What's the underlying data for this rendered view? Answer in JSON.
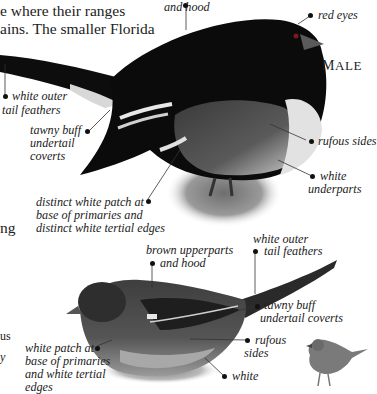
{
  "body_text": {
    "line1": "e where their ranges",
    "line2": "ains. The smaller Florida",
    "fragment_ng": "ng",
    "fragment_us": "us",
    "fragment_y": "y"
  },
  "male": {
    "sex_label_first": "M",
    "sex_label_rest": "ALE",
    "labels": {
      "hood": "and hood",
      "eyes": "red eyes",
      "outer_tail": [
        "white outer",
        "tail feathers"
      ],
      "undertail": [
        "tawny buff",
        "undertail",
        "coverts"
      ],
      "sides": "rufous sides",
      "underparts": [
        "white",
        "underparts"
      ],
      "wing_patch": [
        "distinct white patch at",
        "base of primaries and",
        "distinct white tertial edges"
      ]
    }
  },
  "female": {
    "labels": {
      "upperparts": [
        "brown upperparts",
        "and hood"
      ],
      "outer_tail": [
        "white outer",
        "tail feathers"
      ],
      "undertail": [
        "tawny buff",
        "undertail coverts"
      ],
      "sides": [
        "rufous",
        "sides"
      ],
      "underparts": [
        "white"
      ],
      "wing_patch": [
        "white patch at",
        "base of primaries",
        "and white tertial",
        "edges"
      ]
    }
  },
  "colors": {
    "ink": "#111111",
    "text": "#222222",
    "background": "#ffffff"
  }
}
